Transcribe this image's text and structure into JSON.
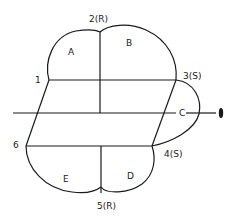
{
  "diagram": {
    "type": "flow-pattern-diagram",
    "points": [
      {
        "id": "1",
        "label": "1"
      },
      {
        "id": "2",
        "label": "2(R)"
      },
      {
        "id": "3",
        "label": "3(S)"
      },
      {
        "id": "4",
        "label": "4(S)"
      },
      {
        "id": "5",
        "label": "5(R)"
      },
      {
        "id": "6",
        "label": "6"
      }
    ],
    "regions": [
      {
        "id": "A",
        "label": "A"
      },
      {
        "id": "B",
        "label": "B"
      },
      {
        "id": "C",
        "label": "C"
      },
      {
        "id": "D",
        "label": "D"
      },
      {
        "id": "E",
        "label": "E"
      }
    ],
    "colors": {
      "stroke": "#1a1a1a",
      "background": "#ffffff"
    }
  }
}
